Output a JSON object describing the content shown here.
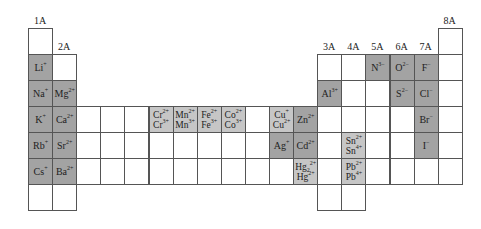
{
  "grid": {
    "left": 28,
    "top": 28,
    "cell_w": 24.1,
    "cell_h": 26
  },
  "group_labels": [
    {
      "label": "1A",
      "col": 1,
      "row": 1
    },
    {
      "label": "2A",
      "col": 2,
      "row": 2
    },
    {
      "label": "3A",
      "col": 13,
      "row": 2
    },
    {
      "label": "4A",
      "col": 14,
      "row": 2
    },
    {
      "label": "5A",
      "col": 15,
      "row": 2
    },
    {
      "label": "6A",
      "col": 16,
      "row": 2
    },
    {
      "label": "7A",
      "col": 17,
      "row": 2
    },
    {
      "label": "8A",
      "col": 18,
      "row": 1
    }
  ],
  "colors": {
    "dark": "#a3a3a3",
    "light": "#c6c6c6",
    "empty": "#ffffff",
    "border": "#555555"
  },
  "cells": [
    {
      "row": 1,
      "col": 1
    },
    {
      "row": 1,
      "col": 18
    },
    {
      "row": 2,
      "col": 1,
      "shade": "dark",
      "ions": [
        {
          "sym": "Li",
          "sup": "+"
        }
      ]
    },
    {
      "row": 2,
      "col": 2
    },
    {
      "row": 2,
      "col": 13
    },
    {
      "row": 2,
      "col": 14
    },
    {
      "row": 2,
      "col": 15,
      "shade": "dark",
      "ions": [
        {
          "sym": "N",
          "sup": "3−"
        }
      ]
    },
    {
      "row": 2,
      "col": 16,
      "shade": "dark",
      "ions": [
        {
          "sym": "O",
          "sup": "2−"
        }
      ]
    },
    {
      "row": 2,
      "col": 17,
      "shade": "dark",
      "ions": [
        {
          "sym": "F",
          "sup": "−"
        }
      ]
    },
    {
      "row": 2,
      "col": 18
    },
    {
      "row": 3,
      "col": 1,
      "shade": "dark",
      "ions": [
        {
          "sym": "Na",
          "sup": "+"
        }
      ]
    },
    {
      "row": 3,
      "col": 2,
      "shade": "dark",
      "ions": [
        {
          "sym": "Mg",
          "sup": "2+"
        }
      ]
    },
    {
      "row": 3,
      "col": 13,
      "shade": "dark",
      "ions": [
        {
          "sym": "Al",
          "sup": "3+"
        }
      ]
    },
    {
      "row": 3,
      "col": 14
    },
    {
      "row": 3,
      "col": 15
    },
    {
      "row": 3,
      "col": 16,
      "shade": "dark",
      "ions": [
        {
          "sym": "S",
          "sup": "2−"
        }
      ]
    },
    {
      "row": 3,
      "col": 17,
      "shade": "dark",
      "ions": [
        {
          "sym": "Cl",
          "sup": "−"
        }
      ]
    },
    {
      "row": 3,
      "col": 18
    },
    {
      "row": 4,
      "col": 1,
      "shade": "dark",
      "ions": [
        {
          "sym": "K",
          "sup": "+"
        }
      ]
    },
    {
      "row": 4,
      "col": 2,
      "shade": "dark",
      "ions": [
        {
          "sym": "Ca",
          "sup": "2+"
        }
      ]
    },
    {
      "row": 4,
      "col": 3
    },
    {
      "row": 4,
      "col": 4
    },
    {
      "row": 4,
      "col": 5
    },
    {
      "row": 4,
      "col": 6,
      "shade": "light",
      "ions": [
        {
          "sym": "Cr",
          "sup": "2+"
        },
        {
          "sym": "Cr",
          "sup": "3+"
        }
      ]
    },
    {
      "row": 4,
      "col": 7,
      "shade": "light",
      "ions": [
        {
          "sym": "Mn",
          "sup": "2+"
        },
        {
          "sym": "Mn",
          "sup": "3+"
        }
      ]
    },
    {
      "row": 4,
      "col": 8,
      "shade": "light",
      "ions": [
        {
          "sym": "Fe",
          "sup": "2+"
        },
        {
          "sym": "Fe",
          "sup": "3+"
        }
      ]
    },
    {
      "row": 4,
      "col": 9,
      "shade": "light",
      "ions": [
        {
          "sym": "Co",
          "sup": "2+"
        },
        {
          "sym": "Co",
          "sup": "3+"
        }
      ]
    },
    {
      "row": 4,
      "col": 10
    },
    {
      "row": 4,
      "col": 11,
      "shade": "light",
      "ions": [
        {
          "sym": "Cu",
          "sup": "+"
        },
        {
          "sym": "Cu",
          "sup": "2+"
        }
      ]
    },
    {
      "row": 4,
      "col": 12,
      "shade": "dark",
      "ions": [
        {
          "sym": "Zn",
          "sup": "2+"
        }
      ]
    },
    {
      "row": 4,
      "col": 13
    },
    {
      "row": 4,
      "col": 14
    },
    {
      "row": 4,
      "col": 15
    },
    {
      "row": 4,
      "col": 16
    },
    {
      "row": 4,
      "col": 17,
      "shade": "dark",
      "ions": [
        {
          "sym": "Br",
          "sup": "−"
        }
      ]
    },
    {
      "row": 4,
      "col": 18
    },
    {
      "row": 5,
      "col": 1,
      "shade": "dark",
      "ions": [
        {
          "sym": "Rb",
          "sup": "+"
        }
      ]
    },
    {
      "row": 5,
      "col": 2,
      "shade": "dark",
      "ions": [
        {
          "sym": "Sr",
          "sup": "2+"
        }
      ]
    },
    {
      "row": 5,
      "col": 3
    },
    {
      "row": 5,
      "col": 4
    },
    {
      "row": 5,
      "col": 5
    },
    {
      "row": 5,
      "col": 6
    },
    {
      "row": 5,
      "col": 7
    },
    {
      "row": 5,
      "col": 8
    },
    {
      "row": 5,
      "col": 9
    },
    {
      "row": 5,
      "col": 10
    },
    {
      "row": 5,
      "col": 11,
      "shade": "dark",
      "ions": [
        {
          "sym": "Ag",
          "sup": "+"
        }
      ]
    },
    {
      "row": 5,
      "col": 12,
      "shade": "dark",
      "ions": [
        {
          "sym": "Cd",
          "sup": "2+"
        }
      ]
    },
    {
      "row": 5,
      "col": 13
    },
    {
      "row": 5,
      "col": 14,
      "shade": "light",
      "ions": [
        {
          "sym": "Sn",
          "sup": "2+"
        },
        {
          "sym": "Sn",
          "sup": "4+"
        }
      ]
    },
    {
      "row": 5,
      "col": 15
    },
    {
      "row": 5,
      "col": 16
    },
    {
      "row": 5,
      "col": 17,
      "shade": "dark",
      "ions": [
        {
          "sym": "I",
          "sup": "−"
        }
      ]
    },
    {
      "row": 5,
      "col": 18
    },
    {
      "row": 6,
      "col": 1,
      "shade": "dark",
      "ions": [
        {
          "sym": "Cs",
          "sup": "+"
        }
      ]
    },
    {
      "row": 6,
      "col": 2,
      "shade": "dark",
      "ions": [
        {
          "sym": "Ba",
          "sup": "2+"
        }
      ]
    },
    {
      "row": 6,
      "col": 3
    },
    {
      "row": 6,
      "col": 4
    },
    {
      "row": 6,
      "col": 5
    },
    {
      "row": 6,
      "col": 6
    },
    {
      "row": 6,
      "col": 7
    },
    {
      "row": 6,
      "col": 8
    },
    {
      "row": 6,
      "col": 9
    },
    {
      "row": 6,
      "col": 10
    },
    {
      "row": 6,
      "col": 11
    },
    {
      "row": 6,
      "col": 12,
      "shade": "light",
      "ions": [
        {
          "sym": "Hg",
          "sub": "2",
          "sup": "2+"
        },
        {
          "sym": "Hg",
          "sup": "2+"
        }
      ]
    },
    {
      "row": 6,
      "col": 13
    },
    {
      "row": 6,
      "col": 14,
      "shade": "light",
      "ions": [
        {
          "sym": "Pb",
          "sup": "2+"
        },
        {
          "sym": "Pb",
          "sup": "4+"
        }
      ]
    },
    {
      "row": 6,
      "col": 15
    },
    {
      "row": 6,
      "col": 16
    },
    {
      "row": 6,
      "col": 17
    },
    {
      "row": 6,
      "col": 18
    },
    {
      "row": 7,
      "col": 1
    },
    {
      "row": 7,
      "col": 2
    },
    {
      "row": 7,
      "col": 13
    },
    {
      "row": 7,
      "col": 14
    }
  ]
}
